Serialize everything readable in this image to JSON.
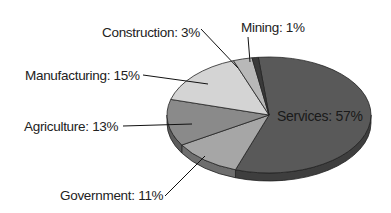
{
  "chart_data": {
    "type": "pie",
    "title": "",
    "style": "3d-tilted",
    "slices": [
      {
        "label": "Services",
        "value": 57,
        "text": "Services: 57%",
        "color": "#595959",
        "side": "#3e3e3e"
      },
      {
        "label": "Government",
        "value": 11,
        "text": "Government: 11%",
        "color": "#a6a6a6",
        "side": "#6e6e6e"
      },
      {
        "label": "Agriculture",
        "value": 13,
        "text": "Agriculture: 13%",
        "color": "#8a8a8a",
        "side": "#5c5c5c"
      },
      {
        "label": "Manufacturing",
        "value": 15,
        "text": "Manufacturing: 15%",
        "color": "#d4d4d4",
        "side": "#9a9a9a"
      },
      {
        "label": "Construction",
        "value": 3,
        "text": "Construction: 3%",
        "color": "#b8b8b8",
        "side": "#808080"
      },
      {
        "label": "Mining",
        "value": 1,
        "text": "Mining: 1%",
        "color": "#3a3a3a",
        "side": "#2a2a2a"
      }
    ],
    "unit": "%",
    "legend": "none (callout labels)"
  }
}
